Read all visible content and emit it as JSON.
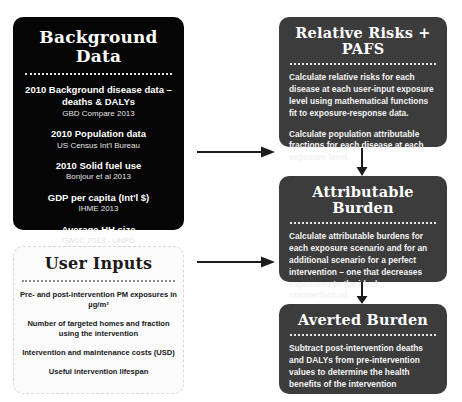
{
  "background_data": {
    "title": "Background Data",
    "items": [
      {
        "label": "2010 Background disease data – deaths & DALYs",
        "source": "GBD Compare 2013"
      },
      {
        "label": "2010 Population data",
        "source": "US Census Int'l Bureau"
      },
      {
        "label": "2010 Solid fuel use",
        "source": "Bonjour et al 2013"
      },
      {
        "label": "GDP per capita (Int'l $)",
        "source": "IHME 2013"
      },
      {
        "label": "Average HH size",
        "source": "GACC 2013 - UNPD"
      }
    ]
  },
  "user_inputs": {
    "title": "User Inputs",
    "items": [
      "Pre- and post-intervention PM exposures in µg/m³",
      "Number of targeted homes and fraction using the intervention",
      "Intervention and maintenance costs (USD)",
      "Useful intervention lifespan"
    ]
  },
  "steps": [
    {
      "title": "Relative Risks + PAFS",
      "paragraphs": [
        "Calculate relative risks for each disease at each user-input exposure level using mathematical functions fit to exposure-response data.",
        "Calculate population attributable fractions for each disease at each exposure level."
      ]
    },
    {
      "title": "Attributable Burden",
      "paragraphs": [
        "Calculate attributable burdens for each exposure scenario and for an additional scenario for a perfect intervention – one that decreases exposures to the ideal counterfactual."
      ]
    },
    {
      "title": "Averted Burden",
      "paragraphs": [
        "Subtract post-intervention deaths and DALYs from pre-intervention values to determine the health benefits of the intervention"
      ]
    }
  ],
  "colors": {
    "background_data_bg": "#050505",
    "user_inputs_bg": "#fbfbfb",
    "step_bg": "#3c3c3c",
    "arrow": "#1c1c1c",
    "page_bg": "#ffffff"
  }
}
